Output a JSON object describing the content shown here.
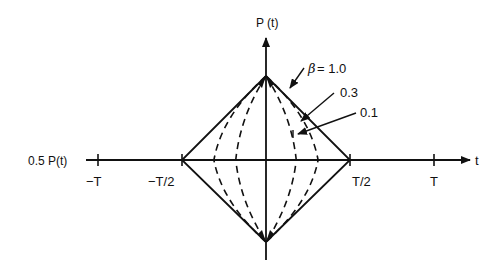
{
  "diagram": {
    "vertical_axis_label": "P (t)",
    "horizontal_axis_label": "t",
    "left_axis_label": "0.5 P(t)",
    "ticks": [
      {
        "id": "neg-t",
        "label": "−T",
        "value": -1.0
      },
      {
        "id": "neg-half-t",
        "label": "−T/2",
        "value": -0.5
      },
      {
        "id": "half-t",
        "label": "T/2",
        "value": 0.5
      },
      {
        "id": "t",
        "label": "T",
        "value": 1.0
      }
    ],
    "curves": [
      {
        "beta": 1.0,
        "label_text": "= 1.0",
        "symbol": "β",
        "style": "solid",
        "half_width": 0.5
      },
      {
        "beta": 0.3,
        "label_text": "0.3",
        "style": "dashed",
        "half_width": 0.31
      },
      {
        "beta": 0.1,
        "label_text": "0.1",
        "style": "dashed",
        "half_width": 0.18
      }
    ]
  }
}
